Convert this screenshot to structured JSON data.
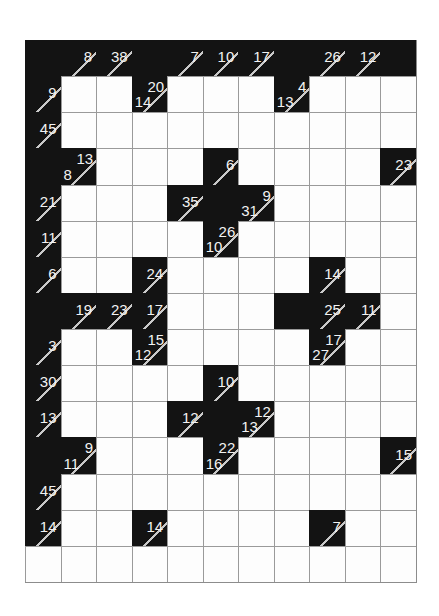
{
  "puzzle": {
    "name": "kakuro-grid",
    "type": "kakuro",
    "columns": 11,
    "rows": 15,
    "colors": {
      "block": "#131313",
      "open": "#fdfdfd",
      "clue_text": "#f2f2f2",
      "grid_line": "#9a9a9a",
      "slash": "#c9c9c9",
      "background": "#ffffff"
    },
    "cells": [
      [
        {
          "t": "block"
        },
        {
          "t": "block",
          "slash": true,
          "right": "8"
        },
        {
          "t": "block",
          "slash": true,
          "right": "38"
        },
        {
          "t": "block"
        },
        {
          "t": "block",
          "slash": true,
          "right": "7"
        },
        {
          "t": "block",
          "slash": true,
          "right": "10"
        },
        {
          "t": "block",
          "slash": true,
          "right": "17"
        },
        {
          "t": "block"
        },
        {
          "t": "block",
          "slash": true,
          "right": "26"
        },
        {
          "t": "block",
          "slash": true,
          "right": "12"
        },
        {
          "t": "block"
        }
      ],
      [
        {
          "t": "block",
          "slash": true,
          "right": "9"
        },
        {
          "t": "open"
        },
        {
          "t": "open"
        },
        {
          "t": "block",
          "slash": true,
          "right": "20",
          "down": "14"
        },
        {
          "t": "open"
        },
        {
          "t": "open"
        },
        {
          "t": "open"
        },
        {
          "t": "block",
          "slash": true,
          "right": "4",
          "down": "13"
        },
        {
          "t": "open"
        },
        {
          "t": "open"
        },
        {
          "t": "open"
        }
      ],
      [
        {
          "t": "block",
          "slash": true,
          "right": "45"
        },
        {
          "t": "open"
        },
        {
          "t": "open"
        },
        {
          "t": "open"
        },
        {
          "t": "open"
        },
        {
          "t": "open"
        },
        {
          "t": "open"
        },
        {
          "t": "open"
        },
        {
          "t": "open"
        },
        {
          "t": "open"
        },
        {
          "t": "open"
        }
      ],
      [
        {
          "t": "block"
        },
        {
          "t": "block",
          "slash": true,
          "right": "13",
          "down": "8"
        },
        {
          "t": "open"
        },
        {
          "t": "open"
        },
        {
          "t": "open"
        },
        {
          "t": "block",
          "slash": true,
          "right": "6"
        },
        {
          "t": "open"
        },
        {
          "t": "open"
        },
        {
          "t": "open"
        },
        {
          "t": "open"
        },
        {
          "t": "block",
          "slash": true,
          "right": "23"
        }
      ],
      [
        {
          "t": "block",
          "slash": true,
          "right": "21"
        },
        {
          "t": "open"
        },
        {
          "t": "open"
        },
        {
          "t": "open"
        },
        {
          "t": "block",
          "slash": true,
          "right": "35"
        },
        {
          "t": "block"
        },
        {
          "t": "block",
          "slash": true,
          "right": "9",
          "down": "31"
        },
        {
          "t": "open"
        },
        {
          "t": "open"
        },
        {
          "t": "open"
        },
        {
          "t": "open"
        }
      ],
      [
        {
          "t": "block",
          "slash": true,
          "right": "11"
        },
        {
          "t": "open"
        },
        {
          "t": "open"
        },
        {
          "t": "open"
        },
        {
          "t": "open"
        },
        {
          "t": "block",
          "slash": true,
          "right": "26",
          "down": "10"
        },
        {
          "t": "open"
        },
        {
          "t": "open"
        },
        {
          "t": "open"
        },
        {
          "t": "open"
        },
        {
          "t": "open"
        }
      ],
      [
        {
          "t": "block",
          "slash": true,
          "right": "6"
        },
        {
          "t": "open"
        },
        {
          "t": "open"
        },
        {
          "t": "block",
          "slash": true,
          "right": "24"
        },
        {
          "t": "open"
        },
        {
          "t": "open"
        },
        {
          "t": "open"
        },
        {
          "t": "open"
        },
        {
          "t": "block",
          "slash": true,
          "right": "14"
        },
        {
          "t": "open"
        },
        {
          "t": "open"
        }
      ],
      [
        {
          "t": "block"
        },
        {
          "t": "block",
          "slash": true,
          "right": "19"
        },
        {
          "t": "block",
          "slash": true,
          "right": "23"
        },
        {
          "t": "block",
          "slash": true,
          "right": "17"
        },
        {
          "t": "open"
        },
        {
          "t": "open"
        },
        {
          "t": "open"
        },
        {
          "t": "block"
        },
        {
          "t": "block",
          "slash": true,
          "right": "25"
        },
        {
          "t": "block",
          "slash": true,
          "right": "11"
        },
        {
          "t": "open"
        }
      ],
      [
        {
          "t": "block",
          "slash": true,
          "right": "3"
        },
        {
          "t": "open"
        },
        {
          "t": "open"
        },
        {
          "t": "block",
          "slash": true,
          "right": "15",
          "down": "12"
        },
        {
          "t": "open"
        },
        {
          "t": "open"
        },
        {
          "t": "open"
        },
        {
          "t": "open"
        },
        {
          "t": "block",
          "slash": true,
          "right": "17",
          "down": "27"
        },
        {
          "t": "open"
        },
        {
          "t": "open"
        }
      ],
      [
        {
          "t": "block",
          "slash": true,
          "right": "30"
        },
        {
          "t": "open"
        },
        {
          "t": "open"
        },
        {
          "t": "open"
        },
        {
          "t": "open"
        },
        {
          "t": "block",
          "slash": true,
          "right": "10"
        },
        {
          "t": "open"
        },
        {
          "t": "open"
        },
        {
          "t": "open"
        },
        {
          "t": "open"
        },
        {
          "t": "open"
        }
      ],
      [
        {
          "t": "block",
          "slash": true,
          "right": "13"
        },
        {
          "t": "open"
        },
        {
          "t": "open"
        },
        {
          "t": "open"
        },
        {
          "t": "block",
          "slash": true,
          "right": "12"
        },
        {
          "t": "block"
        },
        {
          "t": "block",
          "slash": true,
          "right": "12",
          "down": "13"
        },
        {
          "t": "open"
        },
        {
          "t": "open"
        },
        {
          "t": "open"
        },
        {
          "t": "open"
        }
      ],
      [
        {
          "t": "block"
        },
        {
          "t": "block",
          "slash": true,
          "right": "9",
          "down": "11"
        },
        {
          "t": "open"
        },
        {
          "t": "open"
        },
        {
          "t": "open"
        },
        {
          "t": "block",
          "slash": true,
          "right": "22",
          "down": "16"
        },
        {
          "t": "open"
        },
        {
          "t": "open"
        },
        {
          "t": "open"
        },
        {
          "t": "open"
        },
        {
          "t": "block",
          "slash": true,
          "right": "15"
        }
      ],
      [
        {
          "t": "block",
          "slash": true,
          "right": "45"
        },
        {
          "t": "open"
        },
        {
          "t": "open"
        },
        {
          "t": "open"
        },
        {
          "t": "open"
        },
        {
          "t": "open"
        },
        {
          "t": "open"
        },
        {
          "t": "open"
        },
        {
          "t": "open"
        },
        {
          "t": "open"
        },
        {
          "t": "open"
        }
      ],
      [
        {
          "t": "block",
          "slash": true,
          "right": "14"
        },
        {
          "t": "open"
        },
        {
          "t": "open"
        },
        {
          "t": "block",
          "slash": true,
          "right": "14"
        },
        {
          "t": "open"
        },
        {
          "t": "open"
        },
        {
          "t": "open"
        },
        {
          "t": "open"
        },
        {
          "t": "block",
          "slash": true,
          "right": "7"
        },
        {
          "t": "open"
        },
        {
          "t": "open"
        }
      ],
      [
        {
          "t": "open"
        },
        {
          "t": "open"
        },
        {
          "t": "open"
        },
        {
          "t": "open"
        },
        {
          "t": "open"
        },
        {
          "t": "open"
        },
        {
          "t": "open"
        },
        {
          "t": "open"
        },
        {
          "t": "open"
        },
        {
          "t": "open"
        },
        {
          "t": "open"
        }
      ]
    ]
  }
}
